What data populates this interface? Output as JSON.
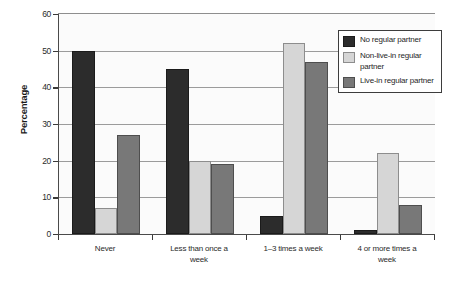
{
  "chart_data": {
    "type": "bar",
    "title": "",
    "xlabel": "",
    "ylabel": "Percentage",
    "ylim": [
      0,
      60
    ],
    "yticks": [
      0,
      10,
      20,
      30,
      40,
      50,
      60
    ],
    "ytick_labels": [
      "0",
      "10",
      "20",
      "30",
      "40",
      "50",
      "60"
    ],
    "grid": true,
    "legend_position": "top-right",
    "categories": [
      "Never",
      "Less than once a\nweek",
      "1–3 times a week",
      "4 or more times a\nweek"
    ],
    "category_lines": [
      [
        "Never"
      ],
      [
        "Less than once a",
        "week"
      ],
      [
        "1–3 times a week"
      ],
      [
        "4 or more times a",
        "week"
      ]
    ],
    "series": [
      {
        "name": "No regular partner",
        "color": "#2c2c2c",
        "values": [
          50,
          45,
          5,
          1
        ]
      },
      {
        "name": "Non-live-in regular partner",
        "color": "#d6d6d6",
        "values": [
          7,
          20,
          52,
          22
        ]
      },
      {
        "name": "Live-in regular partner",
        "color": "#787878",
        "values": [
          27,
          19,
          47,
          8
        ]
      }
    ],
    "legend": [
      {
        "label_lines": [
          "No regular partner"
        ],
        "swatch": "s0"
      },
      {
        "label_lines": [
          "Non-live-in regular",
          "partner"
        ],
        "swatch": "s1"
      },
      {
        "label_lines": [
          "Live-in regular partner"
        ],
        "swatch": "s2"
      }
    ]
  },
  "axis": {
    "y_title": "Percentage"
  }
}
